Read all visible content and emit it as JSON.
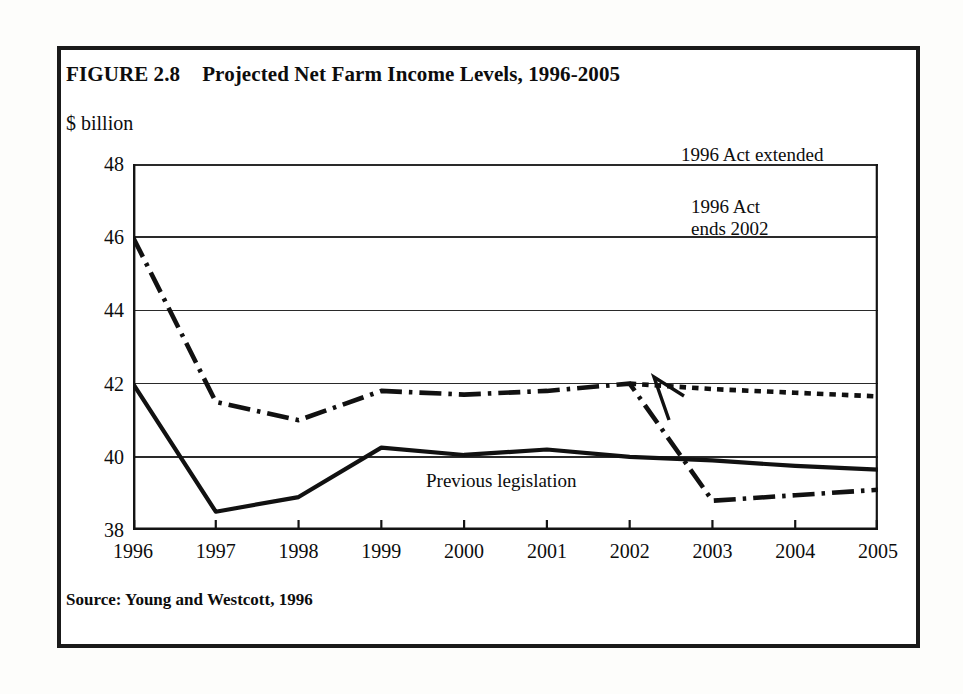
{
  "figure": {
    "number_label": "FIGURE 2.8",
    "title": "Projected Net Farm Income Levels, 1996-2005",
    "unit_label": "$ billion",
    "source_note": "Source: Young and Westcott, 1996"
  },
  "annotations": {
    "act_extended": "1996 Act extended",
    "act_ends_line1": "1996 Act",
    "act_ends_line2": "ends 2002",
    "previous_legislation": "Previous legislation"
  },
  "colors": {
    "ink": "#111111",
    "frame": "#1a1a1a",
    "grid": "#2a2a2a",
    "paper": "#ffffff"
  },
  "chart_data": {
    "type": "line",
    "title": "Projected Net Farm Income Levels, 1996-2005",
    "subtitle": "FIGURE 2.8",
    "xlabel": "",
    "ylabel": "$ billion",
    "xlim": [
      1996,
      2005
    ],
    "ylim": [
      38,
      48
    ],
    "ytick_labels": [
      "38",
      "40",
      "42",
      "44",
      "46",
      "48"
    ],
    "yticks": [
      38,
      40,
      42,
      44,
      46,
      48
    ],
    "xtick_labels": [
      "1996",
      "1997",
      "1998",
      "1999",
      "2000",
      "2001",
      "2002",
      "2003",
      "2004",
      "2005"
    ],
    "xticks": [
      1996,
      1997,
      1998,
      1999,
      2000,
      2001,
      2002,
      2003,
      2004,
      2005
    ],
    "grid": "horizontal",
    "legend": "inline annotations",
    "source": "Young and Westcott, 1996",
    "x": [
      1996,
      1997,
      1998,
      1999,
      2000,
      2001,
      2002,
      2003,
      2004,
      2005
    ],
    "series": [
      {
        "name": "Previous legislation",
        "style": "solid",
        "x": [
          1996,
          1997,
          1998,
          1999,
          2000,
          2001,
          2002,
          2003,
          2004,
          2005
        ],
        "values": [
          42.0,
          38.5,
          38.9,
          40.25,
          40.05,
          40.2,
          40.0,
          39.9,
          39.75,
          39.65
        ]
      },
      {
        "name": "1996 Act ends 2002",
        "style": "dash-dot",
        "x": [
          1996,
          1997,
          1998,
          1999,
          2000,
          2001,
          2002,
          2003,
          2004,
          2005
        ],
        "values": [
          46.0,
          41.5,
          41.0,
          41.8,
          41.7,
          41.8,
          42.0,
          38.8,
          38.95,
          39.1
        ]
      },
      {
        "name": "1996 Act extended",
        "style": "dotted",
        "x": [
          2002,
          2003,
          2004,
          2005
        ],
        "values": [
          42.0,
          41.85,
          41.75,
          41.65
        ]
      }
    ],
    "annotations": [
      {
        "text": "1996 Act extended",
        "x": 2003.5,
        "y": 42.6
      },
      {
        "text": "1996 Act ends 2002",
        "x": 2003.0,
        "y": 41.3
      },
      {
        "text": "Previous legislation",
        "x": 2000.2,
        "y": 39.4
      }
    ]
  }
}
